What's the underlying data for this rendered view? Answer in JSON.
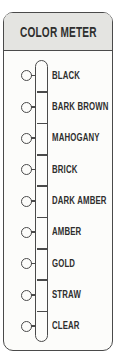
{
  "panel": {
    "title": "COLOR METER"
  },
  "meter": {
    "items": [
      {
        "label": "BLACK"
      },
      {
        "label": "BARK BROWN"
      },
      {
        "label": "MAHOGANY"
      },
      {
        "label": "BRICK"
      },
      {
        "label": "DARK AMBER"
      },
      {
        "label": "AMBER"
      },
      {
        "label": "GOLD"
      },
      {
        "label": "STRAW"
      },
      {
        "label": "CLEAR"
      }
    ]
  },
  "colors": {
    "line": "#4a4a4a",
    "text": "#2e2e2e",
    "header_bg": "#e4e4e1",
    "panel_bg": "#fcfcfa",
    "page_bg": "#ffffff"
  }
}
